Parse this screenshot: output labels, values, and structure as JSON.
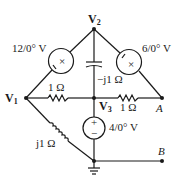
{
  "diagram": {
    "type": "ac-circuit-schematic",
    "nodes": {
      "v1": {
        "label": "V",
        "sub": "1"
      },
      "v2": {
        "label": "V",
        "sub": "2"
      },
      "v3": {
        "label": "V",
        "sub": "3"
      },
      "a": {
        "label": "A"
      },
      "b": {
        "label": "B"
      }
    },
    "components": {
      "source_left": {
        "label": "12/0° V",
        "magnitude": "12",
        "angle": "0°",
        "unit": "V"
      },
      "source_right": {
        "label": "6/0° V",
        "magnitude": "6",
        "angle": "0°",
        "unit": "V"
      },
      "source_bottom": {
        "label": "4/0° V",
        "magnitude": "4",
        "angle": "0°",
        "unit": "V",
        "plus": "+",
        "minus": "−"
      },
      "capacitor": {
        "label": "−j1 Ω"
      },
      "resistor_left": {
        "label": "1 Ω"
      },
      "resistor_right": {
        "label": "1 Ω"
      },
      "inductor": {
        "label": "j1 Ω"
      }
    },
    "ground": "ground-symbol",
    "colors": {
      "ink": "#1a1a1a",
      "background": "#ffffff"
    }
  }
}
